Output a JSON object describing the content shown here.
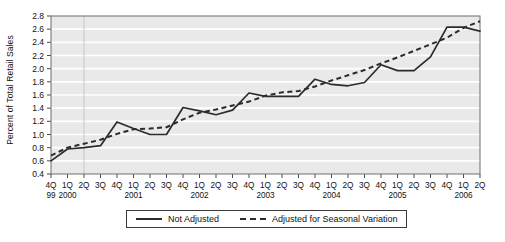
{
  "chart_data": {
    "type": "line",
    "title": "",
    "xlabel": "",
    "ylabel": "Percent of Total Retail Sales",
    "ylim": [
      0.4,
      2.8
    ],
    "ytick_step": 0.2,
    "yticks": [
      "2.8",
      "2.6",
      "2.4",
      "2.2",
      "2.0",
      "1.8",
      "1.6",
      "1.4",
      "1.2",
      "1.0",
      "0.8",
      "0.6",
      "0.4"
    ],
    "grid": true,
    "grid_color": "#ffffff",
    "plot_background": "#e9e9e9",
    "line_color": "#2b2b2b",
    "legend_position": "bottom",
    "categories": [
      "4Q",
      "1Q",
      "2Q",
      "3Q",
      "4Q",
      "1Q",
      "2Q",
      "3Q",
      "4Q",
      "1Q",
      "2Q",
      "3Q",
      "4Q",
      "1Q",
      "2Q",
      "3Q",
      "4Q",
      "1Q",
      "2Q",
      "3Q",
      "4Q",
      "1Q",
      "2Q",
      "3Q",
      "4Q",
      "1Q",
      "2Q"
    ],
    "year_labels": [
      {
        "label": "99",
        "index": 0
      },
      {
        "label": "2000",
        "index": 1
      },
      {
        "label": "2001",
        "index": 5
      },
      {
        "label": "2002",
        "index": 9
      },
      {
        "label": "2003",
        "index": 13
      },
      {
        "label": "2004",
        "index": 17
      },
      {
        "label": "2005",
        "index": 21
      },
      {
        "label": "2006",
        "index": 25
      }
    ],
    "series": [
      {
        "name": "Not Adjusted",
        "style": "solid",
        "values": [
          0.6,
          0.78,
          0.8,
          0.83,
          1.19,
          1.09,
          1.0,
          1.0,
          1.41,
          1.36,
          1.3,
          1.37,
          1.63,
          1.58,
          1.58,
          1.58,
          1.84,
          1.76,
          1.74,
          1.79,
          2.06,
          1.97,
          1.97,
          2.18,
          2.63,
          2.63,
          2.57
        ]
      },
      {
        "name": "Adjusted for Seasonal Variation",
        "style": "dashed",
        "values": [
          0.68,
          0.8,
          0.86,
          0.92,
          1.01,
          1.08,
          1.09,
          1.11,
          1.23,
          1.33,
          1.38,
          1.44,
          1.5,
          1.59,
          1.64,
          1.66,
          1.73,
          1.82,
          1.9,
          1.98,
          2.08,
          2.17,
          2.27,
          2.37,
          2.47,
          2.62,
          2.72
        ]
      }
    ]
  },
  "legend": {
    "entries": [
      {
        "label": "Not Adjusted",
        "style": "solid"
      },
      {
        "label": "Adjusted for Seasonal Variation",
        "style": "dashed"
      }
    ]
  }
}
